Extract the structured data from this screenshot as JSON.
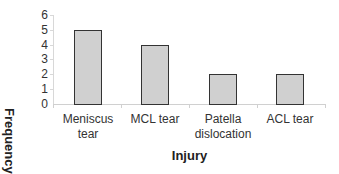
{
  "chart_data": {
    "type": "bar",
    "title": "",
    "xlabel": "Injury",
    "ylabel": "Frequency",
    "categories": [
      "Meniscus tear",
      "MCL tear",
      "Patella dislocation",
      "ACL tear"
    ],
    "category_lines": [
      [
        "Meniscus",
        "tear"
      ],
      [
        "MCL tear"
      ],
      [
        "Patella",
        "dislocation"
      ],
      [
        "ACL tear"
      ]
    ],
    "values": [
      5,
      4,
      2,
      2
    ],
    "ylim": [
      0,
      6
    ],
    "yticks": [
      "6",
      "5",
      "4",
      "3",
      "2",
      "1",
      "0"
    ],
    "grid": false,
    "legend": null,
    "bar_color": "#d0d0d0",
    "bar_edge_color": "#333333"
  }
}
